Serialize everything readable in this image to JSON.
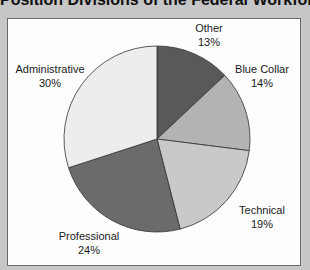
{
  "chart_data": {
    "type": "pie",
    "title": "Position Divisions of the Federal Workforce",
    "categories": [
      "Other",
      "Blue Collar",
      "Technical",
      "Professional",
      "Administrative"
    ],
    "values": [
      13,
      14,
      19,
      24,
      30
    ],
    "unit": "%",
    "start_angle": "12 o'clock, clockwise",
    "colors": [
      "#595959",
      "#b3b3b3",
      "#c9c9c9",
      "#6b6b6b",
      "#ededed"
    ],
    "labels": [
      {
        "name": "Other",
        "pct": "13%"
      },
      {
        "name": "Blue Collar",
        "pct": "14%"
      },
      {
        "name": "Technical",
        "pct": "19%"
      },
      {
        "name": "Professional",
        "pct": "24%"
      },
      {
        "name": "Administrative",
        "pct": "30%"
      }
    ]
  }
}
